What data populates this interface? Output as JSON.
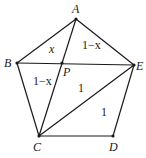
{
  "figure": {
    "type": "pentagon diagram",
    "stroke_color": "#1a1a1a",
    "vertices": {
      "A": {
        "label": "A",
        "x": 76,
        "y": 19
      },
      "B": {
        "label": "B",
        "x": 17,
        "y": 63
      },
      "C": {
        "label": "C",
        "x": 39,
        "y": 136
      },
      "D": {
        "label": "D",
        "x": 113,
        "y": 136
      },
      "E": {
        "label": "E",
        "x": 134,
        "y": 65
      },
      "P": {
        "label": "P",
        "x": 62,
        "y": 63
      }
    },
    "segments": [
      "AB",
      "BC",
      "CD",
      "DE",
      "EA",
      "BE",
      "AC",
      "CE"
    ],
    "region_labels": {
      "ABP": "x",
      "APE": "1−x",
      "BPC": "1−x",
      "PCE": "1",
      "CDE": "1"
    }
  }
}
